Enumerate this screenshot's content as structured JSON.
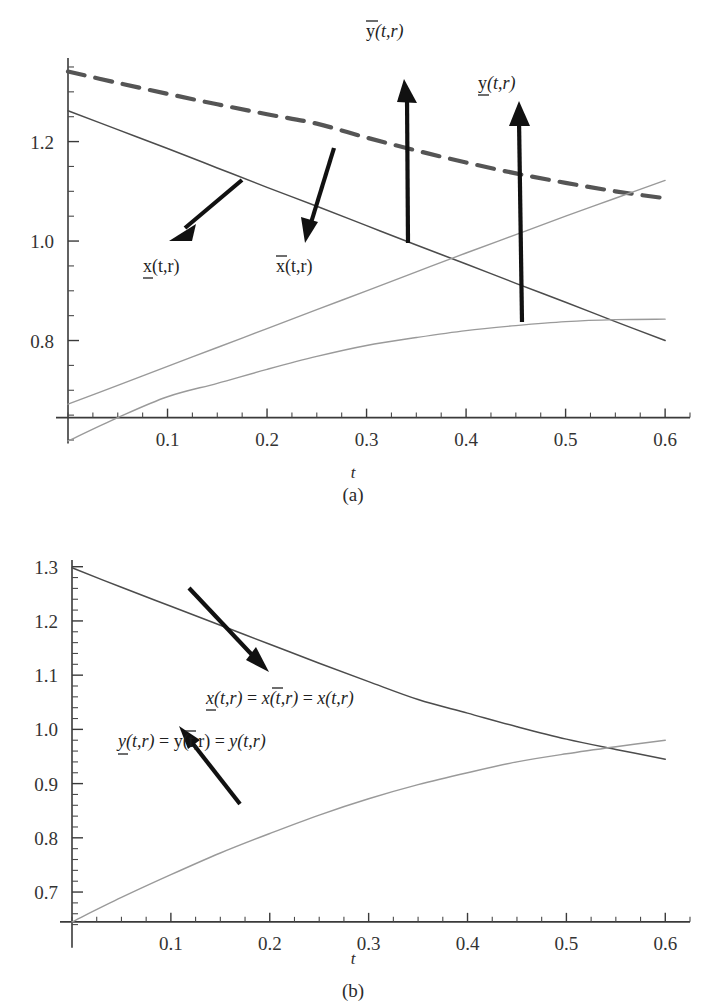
{
  "figure": {
    "panels": [
      {
        "id": "a",
        "caption": "(a)",
        "xlabel": "t",
        "x_ticks": [
          "0.1",
          "0.2",
          "0.3",
          "0.4",
          "0.5",
          "0.6"
        ],
        "y_ticks": [
          "1.2",
          "1.0",
          "0.8"
        ],
        "annotations": [
          {
            "name": "y-upper-label",
            "base": "y",
            "accent": "overbar",
            "suffix": "(t,r)"
          },
          {
            "name": "y-lower-label",
            "base": "y",
            "accent": "underbar",
            "suffix": "(t,r)"
          },
          {
            "name": "x-lower-label",
            "base": "x",
            "accent": "underbar",
            "suffix": "(t,r)"
          },
          {
            "name": "x-upper-label",
            "base": "x",
            "accent": "overbar",
            "suffix": "(t,r)"
          }
        ]
      },
      {
        "id": "b",
        "caption": "(b)",
        "xlabel": "t",
        "x_ticks": [
          "0.1",
          "0.2",
          "0.3",
          "0.4",
          "0.5",
          "0.6"
        ],
        "y_ticks": [
          "1.3",
          "1.2",
          "1.1",
          "1.0",
          "0.9",
          "0.8",
          "0.7"
        ],
        "annotations": [
          {
            "name": "x-equality-label",
            "text": "x(t,r) = x(t,r) = x(t,r)"
          },
          {
            "name": "y-equality-label",
            "text": "y(t,r) = y(t,r) = y(t,r)"
          }
        ]
      }
    ]
  },
  "chart_data": [
    {
      "type": "line",
      "panel": "a",
      "title": "",
      "xlabel": "t",
      "ylabel": "",
      "xlim": [
        0.0,
        0.625
      ],
      "ylim": [
        0.6,
        1.36
      ],
      "axis_baseline_y": 0.645,
      "grid": false,
      "legend": "annotations",
      "xticks": [
        0.1,
        0.2,
        0.3,
        0.4,
        0.5,
        0.6
      ],
      "xtick_labels": [
        "0.1",
        "0.2",
        "0.3",
        "0.4",
        "0.5",
        "0.6"
      ],
      "yticks": [
        1.2,
        1.0,
        0.8
      ],
      "ytick_labels": [
        "1.2",
        "1.0",
        "0.8"
      ],
      "minor_ytick_step": 0.05,
      "minor_xtick_step": 0.025,
      "series": [
        {
          "name": "y-upper",
          "label": "ȳ(t,r)",
          "style": "dashed",
          "x": [
            0.0,
            0.05,
            0.1,
            0.15,
            0.2,
            0.25,
            0.3,
            0.35,
            0.4,
            0.45,
            0.5,
            0.55,
            0.6
          ],
          "y": [
            1.341,
            1.318,
            1.296,
            1.275,
            1.255,
            1.236,
            1.208,
            1.182,
            1.158,
            1.136,
            1.117,
            1.1,
            1.086
          ]
        },
        {
          "name": "x-lower",
          "label": "x̲(t,r)",
          "style": "solid-dark",
          "x": [
            0.0,
            0.05,
            0.1,
            0.15,
            0.2,
            0.25,
            0.3,
            0.35,
            0.4,
            0.45,
            0.5,
            0.55,
            0.6
          ],
          "y": [
            1.262,
            1.224,
            1.186,
            1.147,
            1.108,
            1.07,
            1.031,
            0.992,
            0.954,
            0.915,
            0.877,
            0.838,
            0.8
          ]
        },
        {
          "name": "y-lower",
          "label": "y̲(t,r)",
          "style": "solid-light",
          "x": [
            0.0,
            0.05,
            0.1,
            0.15,
            0.2,
            0.25,
            0.3,
            0.35,
            0.4,
            0.45,
            0.5,
            0.55,
            0.6
          ],
          "y": [
            0.672,
            0.71,
            0.748,
            0.786,
            0.824,
            0.862,
            0.9,
            0.938,
            0.976,
            1.013,
            1.05,
            1.086,
            1.122
          ]
        },
        {
          "name": "x-upper",
          "label": "x̄(t,r)",
          "style": "solid-light",
          "x": [
            0.0,
            0.05,
            0.1,
            0.15,
            0.2,
            0.25,
            0.3,
            0.35,
            0.4,
            0.45,
            0.5,
            0.55,
            0.6
          ],
          "y": [
            0.598,
            0.645,
            0.687,
            0.714,
            0.742,
            0.768,
            0.79,
            0.806,
            0.82,
            0.83,
            0.838,
            0.842,
            0.843
          ]
        }
      ]
    },
    {
      "type": "line",
      "panel": "b",
      "title": "",
      "xlabel": "t",
      "ylabel": "",
      "xlim": [
        0.0,
        0.625
      ],
      "ylim": [
        0.63,
        1.305
      ],
      "axis_baseline_y": 0.645,
      "grid": false,
      "legend": "annotations",
      "xticks": [
        0.1,
        0.2,
        0.3,
        0.4,
        0.5,
        0.6
      ],
      "xtick_labels": [
        "0.1",
        "0.2",
        "0.3",
        "0.4",
        "0.5",
        "0.6"
      ],
      "yticks": [
        1.3,
        1.2,
        1.1,
        1.0,
        0.9,
        0.8,
        0.7
      ],
      "ytick_labels": [
        "1.3",
        "1.2",
        "1.1",
        "1.0",
        "0.9",
        "0.8",
        "0.7"
      ],
      "minor_ytick_step": 0.02,
      "minor_xtick_step": 0.025,
      "series": [
        {
          "name": "x-crisp",
          "label": "x(t,r)",
          "style": "solid-dark",
          "x": [
            0.0,
            0.05,
            0.1,
            0.15,
            0.2,
            0.25,
            0.3,
            0.35,
            0.4,
            0.45,
            0.5,
            0.55,
            0.6
          ],
          "y": [
            1.298,
            1.262,
            1.227,
            1.192,
            1.157,
            1.122,
            1.088,
            1.055,
            1.03,
            1.005,
            0.982,
            0.963,
            0.945
          ]
        },
        {
          "name": "y-crisp",
          "label": "y(t,r)",
          "style": "solid-light",
          "x": [
            0.0,
            0.05,
            0.1,
            0.15,
            0.2,
            0.25,
            0.3,
            0.35,
            0.4,
            0.45,
            0.5,
            0.55,
            0.6
          ],
          "y": [
            0.645,
            0.69,
            0.732,
            0.772,
            0.808,
            0.842,
            0.872,
            0.898,
            0.92,
            0.94,
            0.955,
            0.968,
            0.98
          ]
        }
      ]
    }
  ]
}
